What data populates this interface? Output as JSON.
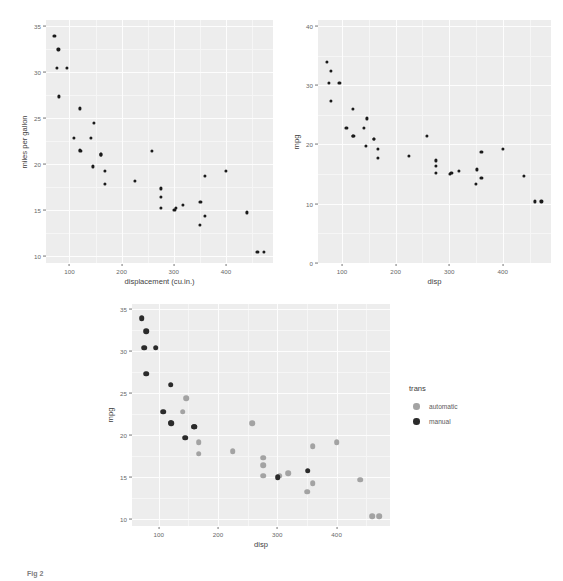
{
  "figure": {
    "caption": "Fig 2"
  },
  "colors": {
    "panel_background": "#ededed",
    "gridline": "#fdfdfd",
    "point_default": "#1a1a1a",
    "manual": "#2b2b2b",
    "automatic": "#a3a3a3",
    "axis_text": "#676767",
    "axis_title": "#3f3f3f"
  },
  "chart_data": [
    {
      "id": "panel-1",
      "type": "scatter",
      "title": "",
      "xlabel": "displacement (cu.in.)",
      "ylabel": "miles per gallon",
      "xlim": [
        55,
        490
      ],
      "ylim": [
        9.2,
        35.6
      ],
      "xticks": [
        100,
        200,
        300,
        400
      ],
      "yticks": [
        10,
        15,
        20,
        25,
        30,
        35
      ],
      "xtick_labels": [
        "100",
        "200",
        "300",
        "400"
      ],
      "ytick_labels": [
        "10",
        "15",
        "20",
        "25",
        "30",
        "35"
      ],
      "grid": true,
      "legend": "none",
      "point_color": "#1a1a1a",
      "point_size": 3.2,
      "x": [
        160,
        160,
        108,
        258,
        360,
        225,
        360,
        146.7,
        140.8,
        167.6,
        167.6,
        275.8,
        275.8,
        275.8,
        472,
        460,
        440,
        78.7,
        75.7,
        71.1,
        120.1,
        318,
        304,
        350,
        400,
        79,
        120.3,
        95.1,
        351,
        145,
        301,
        121
      ],
      "y": [
        21,
        21,
        22.8,
        21.4,
        18.7,
        18.1,
        14.3,
        24.4,
        22.8,
        19.2,
        17.8,
        16.4,
        17.3,
        15.2,
        10.4,
        10.4,
        14.7,
        32.4,
        30.4,
        33.9,
        21.5,
        15.5,
        15.2,
        13.3,
        19.2,
        27.3,
        26,
        30.4,
        15.8,
        19.7,
        15,
        21.4
      ]
    },
    {
      "id": "panel-2",
      "type": "scatter",
      "title": "",
      "xlabel": "disp",
      "ylabel": "mpg",
      "xlim": [
        55,
        490
      ],
      "ylim": [
        0,
        41
      ],
      "xticks": [
        100,
        200,
        300,
        400
      ],
      "yticks": [
        0,
        10,
        20,
        30,
        40
      ],
      "xtick_labels": [
        "100",
        "200",
        "300",
        "400"
      ],
      "ytick_labels": [
        "0",
        "10",
        "20",
        "30",
        "40"
      ],
      "grid": true,
      "legend": "none",
      "point_color": "#1a1a1a",
      "point_size": 3.2,
      "x": [
        160,
        160,
        108,
        258,
        360,
        225,
        360,
        146.7,
        140.8,
        167.6,
        167.6,
        275.8,
        275.8,
        275.8,
        472,
        460,
        440,
        78.7,
        75.7,
        71.1,
        120.1,
        318,
        304,
        350,
        400,
        79,
        120.3,
        95.1,
        351,
        145,
        301,
        121
      ],
      "y": [
        21,
        21,
        22.8,
        21.4,
        18.7,
        18.1,
        14.3,
        24.4,
        22.8,
        19.2,
        17.8,
        16.4,
        17.3,
        15.2,
        10.4,
        10.4,
        14.7,
        32.4,
        30.4,
        33.9,
        21.5,
        15.5,
        15.2,
        13.3,
        19.2,
        27.3,
        26,
        30.4,
        15.8,
        19.7,
        15,
        21.4
      ]
    },
    {
      "id": "panel-3",
      "type": "scatter",
      "title": "",
      "xlabel": "disp",
      "ylabel": "mpg",
      "xlim": [
        55,
        490
      ],
      "ylim": [
        9.2,
        35.6
      ],
      "xticks": [
        100,
        200,
        300,
        400
      ],
      "yticks": [
        10,
        15,
        20,
        25,
        30,
        35
      ],
      "xtick_labels": [
        "100",
        "200",
        "300",
        "400"
      ],
      "ytick_labels": [
        "10",
        "15",
        "20",
        "25",
        "30",
        "35"
      ],
      "grid": true,
      "legend": "right",
      "legend_title": "trans",
      "point_size": 5.6,
      "series": [
        {
          "name": "automatic",
          "color": "#a3a3a3",
          "x": [
            258,
            360,
            225,
            360,
            146.7,
            140.8,
            167.6,
            167.6,
            275.8,
            275.8,
            275.8,
            472,
            460,
            440,
            318,
            304,
            350,
            400
          ],
          "y": [
            21.4,
            18.7,
            18.1,
            14.3,
            24.4,
            22.8,
            19.2,
            17.8,
            16.4,
            17.3,
            15.2,
            10.4,
            10.4,
            14.7,
            15.5,
            15.2,
            13.3,
            19.2
          ]
        },
        {
          "name": "manual",
          "color": "#2b2b2b",
          "x": [
            160,
            160,
            108,
            78.7,
            75.7,
            71.1,
            120.1,
            79,
            120.3,
            95.1,
            351,
            145,
            301,
            121
          ],
          "y": [
            21,
            21,
            22.8,
            32.4,
            30.4,
            33.9,
            21.5,
            27.3,
            26,
            30.4,
            15.8,
            19.7,
            15,
            21.4
          ]
        }
      ]
    }
  ],
  "panels": [
    {
      "name": "panel-1",
      "legend": {
        "title": "",
        "items": []
      }
    },
    {
      "name": "panel-2",
      "legend": {
        "title": "",
        "items": []
      }
    },
    {
      "name": "panel-3",
      "legend": {
        "title": "trans",
        "items": [
          {
            "label": "automatic",
            "color": "#a3a3a3"
          },
          {
            "label": "manual",
            "color": "#2b2b2b"
          }
        ]
      }
    }
  ]
}
